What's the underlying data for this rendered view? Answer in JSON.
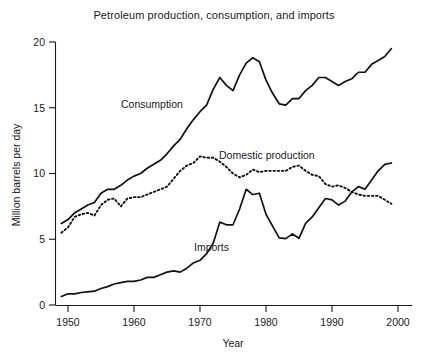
{
  "chart_data": {
    "type": "line",
    "title": "Petroleum production, consumption, and imports",
    "xlabel": "Year",
    "ylabel": "Million barrels per day",
    "xlim": [
      1948,
      2000
    ],
    "ylim": [
      0,
      20
    ],
    "xticks": [
      1950,
      1960,
      1970,
      1980,
      1990,
      2000
    ],
    "xtick_labels": [
      "1950",
      "1960",
      "1970",
      "1980",
      "1990",
      "2000"
    ],
    "yticks": [
      0,
      5,
      10,
      15,
      20
    ],
    "ytick_labels": [
      "0",
      "5",
      "10",
      "15",
      "20"
    ],
    "grid": false,
    "legend_position": "inline-annotations",
    "x": [
      1949,
      1950,
      1951,
      1952,
      1953,
      1954,
      1955,
      1956,
      1957,
      1958,
      1959,
      1960,
      1961,
      1962,
      1963,
      1964,
      1965,
      1966,
      1967,
      1968,
      1969,
      1970,
      1971,
      1972,
      1973,
      1974,
      1975,
      1976,
      1977,
      1978,
      1979,
      1980,
      1981,
      1982,
      1983,
      1984,
      1985,
      1986,
      1987,
      1988,
      1989,
      1990,
      1991,
      1992,
      1993,
      1994,
      1995,
      1996,
      1997,
      1998,
      1999
    ],
    "series": [
      {
        "name": "Consumption",
        "style": "solid",
        "label": "Consumption",
        "values": [
          6.2,
          6.5,
          7.0,
          7.3,
          7.6,
          7.8,
          8.5,
          8.8,
          8.8,
          9.1,
          9.5,
          9.8,
          10.0,
          10.4,
          10.7,
          11.0,
          11.5,
          12.1,
          12.6,
          13.4,
          14.1,
          14.7,
          15.2,
          16.4,
          17.3,
          16.7,
          16.3,
          17.5,
          18.4,
          18.8,
          18.5,
          17.1,
          16.1,
          15.3,
          15.2,
          15.7,
          15.7,
          16.3,
          16.7,
          17.3,
          17.3,
          17.0,
          16.7,
          17.0,
          17.2,
          17.7,
          17.7,
          18.3,
          18.6,
          18.9,
          19.5
        ]
      },
      {
        "name": "Domestic production",
        "style": "dotted",
        "label": "Domestic production",
        "values": [
          5.5,
          5.9,
          6.7,
          6.9,
          7.0,
          6.8,
          7.6,
          8.0,
          8.1,
          7.5,
          8.1,
          8.2,
          8.2,
          8.4,
          8.6,
          8.8,
          9.0,
          9.6,
          10.2,
          10.6,
          10.8,
          11.3,
          11.2,
          11.2,
          10.9,
          10.5,
          10.0,
          9.7,
          9.9,
          10.3,
          10.1,
          10.2,
          10.2,
          10.2,
          10.2,
          10.5,
          10.6,
          10.2,
          9.9,
          9.8,
          9.2,
          9.0,
          9.1,
          8.9,
          8.6,
          8.4,
          8.3,
          8.3,
          8.3,
          8.0,
          7.7
        ]
      },
      {
        "name": "Imports",
        "style": "solid",
        "label": "Imports",
        "values": [
          0.65,
          0.85,
          0.85,
          0.95,
          1.0,
          1.05,
          1.25,
          1.4,
          1.6,
          1.7,
          1.8,
          1.8,
          1.9,
          2.1,
          2.1,
          2.3,
          2.5,
          2.6,
          2.5,
          2.8,
          3.2,
          3.4,
          3.9,
          4.7,
          6.3,
          6.1,
          6.1,
          7.3,
          8.8,
          8.4,
          8.5,
          6.9,
          6.0,
          5.1,
          5.05,
          5.4,
          5.07,
          6.2,
          6.7,
          7.4,
          8.1,
          8.0,
          7.6,
          7.9,
          8.6,
          9.0,
          8.8,
          9.5,
          10.2,
          10.7,
          10.8
        ]
      }
    ],
    "annotations": [
      {
        "text": "Consumption",
        "x_px": 121,
        "y_px": 108
      },
      {
        "text": "Domestic production",
        "x_px": 219,
        "y_px": 159
      },
      {
        "text": "Imports",
        "x_px": 194,
        "y_px": 251
      }
    ],
    "colors": {
      "line": "#111111",
      "axis": "#1a1a1a",
      "background": "#ffffff",
      "text": "#1a1a1a"
    }
  }
}
